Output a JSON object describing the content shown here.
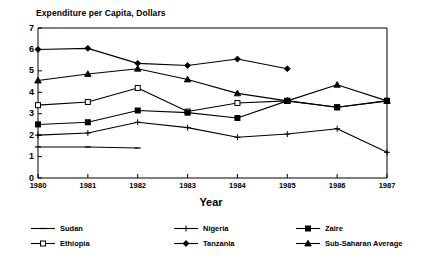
{
  "chart_data": {
    "type": "line",
    "title": "Expenditure per Capita, Dollars",
    "xlabel": "Year",
    "ylabel": "",
    "x": [
      1980,
      1981,
      1982,
      1983,
      1984,
      1985,
      1986,
      1987
    ],
    "xtick_labels": [
      "1980",
      "1981",
      "1982",
      "1983",
      "1984",
      "1985",
      "1986",
      "1987"
    ],
    "ytick_labels": [
      "0",
      "1",
      "2",
      "3",
      "4",
      "5",
      "6",
      "7"
    ],
    "yticks": [
      0,
      1,
      2,
      3,
      4,
      5,
      6,
      7
    ],
    "xlim": [
      1980,
      1987
    ],
    "ylim": [
      0,
      7
    ],
    "grid": false,
    "legend_position": "bottom",
    "series": [
      {
        "name": "Sudan",
        "marker": "dash",
        "values": [
          1.45,
          1.45,
          1.4,
          null,
          null,
          null,
          null,
          null
        ]
      },
      {
        "name": "Ethiopia",
        "marker": "open-square",
        "values": [
          3.4,
          3.55,
          4.2,
          3.1,
          3.5,
          3.6,
          3.3,
          3.6
        ]
      },
      {
        "name": "Nigeria",
        "marker": "plus",
        "values": [
          2.0,
          2.1,
          2.6,
          2.35,
          1.9,
          2.05,
          2.3,
          1.2
        ]
      },
      {
        "name": "Tanzania",
        "marker": "filled-diamond",
        "values": [
          6.0,
          6.05,
          5.35,
          5.25,
          5.55,
          5.1,
          null,
          null
        ]
      },
      {
        "name": "Zaire",
        "marker": "filled-square",
        "values": [
          2.5,
          2.6,
          3.15,
          3.05,
          2.8,
          3.6,
          3.3,
          3.6
        ]
      },
      {
        "name": "Sub-Saharan Average",
        "marker": "filled-triangle",
        "values": [
          4.55,
          4.85,
          5.1,
          4.6,
          3.95,
          3.6,
          4.35,
          3.6
        ]
      }
    ]
  },
  "legend": {
    "items": [
      {
        "label": "Sudan",
        "marker": "dash",
        "col": 0,
        "row": 0
      },
      {
        "label": "Ethiopia",
        "marker": "open-square",
        "col": 0,
        "row": 1
      },
      {
        "label": "Nigeria",
        "marker": "plus",
        "col": 1,
        "row": 0
      },
      {
        "label": "Tanzania",
        "marker": "filled-diamond",
        "col": 1,
        "row": 1
      },
      {
        "label": "Zaire",
        "marker": "filled-square",
        "col": 2,
        "row": 0
      },
      {
        "label": "Sub-Saharan Average",
        "marker": "filled-triangle",
        "col": 2,
        "row": 1
      }
    ]
  },
  "colors": {
    "line": "#000000",
    "axis": "#000000",
    "background": "#ffffff"
  }
}
